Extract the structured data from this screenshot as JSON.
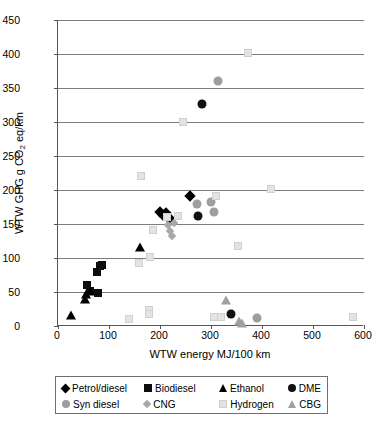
{
  "chart_data": {
    "type": "scatter",
    "title": "",
    "xlabel": "WTW energy MJ/100 km",
    "ylabel": "WTW GHG g CO2 eq/km",
    "ylabel_html": "WTW GHG g CO<sub>2</sub> eq/km",
    "xlim": [
      0,
      600
    ],
    "ylim": [
      0,
      450
    ],
    "xticks": [
      0,
      100,
      200,
      300,
      400,
      500,
      600
    ],
    "yticks": [
      0,
      50,
      100,
      150,
      200,
      250,
      300,
      350,
      400,
      450
    ],
    "grid": "horizontal",
    "legend_position": "bottom",
    "series": [
      {
        "name": "Petrol/diesel",
        "marker": "diamond",
        "color": "#000000",
        "points": [
          {
            "x": 205,
            "y": 163
          },
          {
            "x": 212,
            "y": 166
          },
          {
            "x": 215,
            "y": 160
          },
          {
            "x": 220,
            "y": 158
          },
          {
            "x": 258,
            "y": 191
          },
          {
            "x": 200,
            "y": 168
          }
        ]
      },
      {
        "name": "Biodiesel",
        "marker": "square",
        "color": "#0d0d0d",
        "points": [
          {
            "x": 57,
            "y": 60
          },
          {
            "x": 63,
            "y": 52
          },
          {
            "x": 78,
            "y": 48
          },
          {
            "x": 82,
            "y": 88
          },
          {
            "x": 76,
            "y": 80
          },
          {
            "x": 86,
            "y": 90
          }
        ]
      },
      {
        "name": "Ethanol",
        "marker": "triangle",
        "color": "#000000",
        "points": [
          {
            "x": 25,
            "y": 14
          },
          {
            "x": 52,
            "y": 38
          },
          {
            "x": 55,
            "y": 46
          },
          {
            "x": 63,
            "y": 50
          },
          {
            "x": 160,
            "y": 114
          }
        ]
      },
      {
        "name": "DME",
        "marker": "circle",
        "color": "#111111",
        "points": [
          {
            "x": 275,
            "y": 162
          },
          {
            "x": 283,
            "y": 326
          },
          {
            "x": 340,
            "y": 17
          }
        ]
      },
      {
        "name": "Syn diesel",
        "marker": "circle",
        "color": "#9e9e9e",
        "points": [
          {
            "x": 272,
            "y": 180
          },
          {
            "x": 300,
            "y": 182
          },
          {
            "x": 305,
            "y": 167
          },
          {
            "x": 313,
            "y": 361
          },
          {
            "x": 390,
            "y": 12
          }
        ]
      },
      {
        "name": "CNG",
        "marker": "small-diamond",
        "color": "#a8a8a8",
        "points": [
          {
            "x": 216,
            "y": 148
          },
          {
            "x": 219,
            "y": 140
          },
          {
            "x": 223,
            "y": 132
          },
          {
            "x": 228,
            "y": 151
          }
        ]
      },
      {
        "name": "Hydrogen",
        "marker": "hollow-square",
        "color": "#d0d0d0",
        "points": [
          {
            "x": 140,
            "y": 10
          },
          {
            "x": 158,
            "y": 92
          },
          {
            "x": 163,
            "y": 221
          },
          {
            "x": 178,
            "y": 24
          },
          {
            "x": 178,
            "y": 17
          },
          {
            "x": 180,
            "y": 101
          },
          {
            "x": 186,
            "y": 141
          },
          {
            "x": 213,
            "y": 160
          },
          {
            "x": 235,
            "y": 162
          },
          {
            "x": 245,
            "y": 300
          },
          {
            "x": 310,
            "y": 191
          },
          {
            "x": 305,
            "y": 13
          },
          {
            "x": 320,
            "y": 13
          },
          {
            "x": 352,
            "y": 117
          },
          {
            "x": 372,
            "y": 401
          },
          {
            "x": 418,
            "y": 201
          },
          {
            "x": 578,
            "y": 13
          }
        ]
      },
      {
        "name": "CBG",
        "marker": "triangle",
        "color": "#a0a0a0",
        "points": [
          {
            "x": 330,
            "y": 37
          },
          {
            "x": 355,
            "y": 6
          },
          {
            "x": 360,
            "y": 3
          }
        ]
      }
    ]
  },
  "legend": {
    "entries": [
      {
        "label": "Petrol/diesel"
      },
      {
        "label": "Biodiesel"
      },
      {
        "label": "Ethanol"
      },
      {
        "label": "DME"
      },
      {
        "label": "Syn diesel"
      },
      {
        "label": "CNG"
      },
      {
        "label": "Hydrogen"
      },
      {
        "label": "CBG"
      }
    ]
  }
}
